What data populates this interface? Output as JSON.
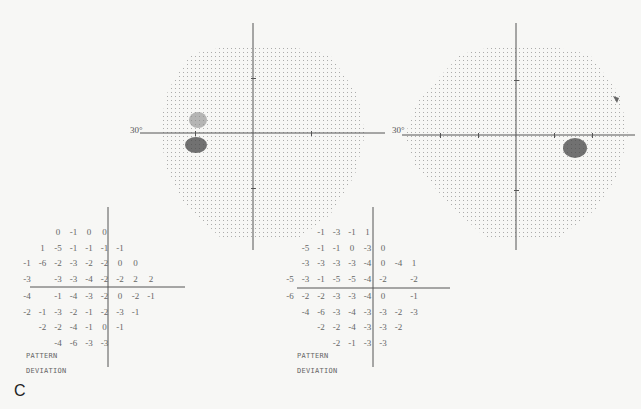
{
  "figure": {
    "panel_letter": "C",
    "left_field": {
      "eccentricity_label": "30°",
      "pattern_label": "PATTERN",
      "deviation_label": "DEVIATION",
      "rows": [
        [
          "",
          "",
          "0",
          "-1",
          "0",
          "0",
          "",
          "",
          ""
        ],
        [
          "",
          "1",
          "-5",
          "-1",
          "-1",
          "-1",
          "-1",
          "",
          ""
        ],
        [
          "-1",
          "-6",
          "-2",
          "-3",
          "-2",
          "-2",
          "0",
          "0",
          ""
        ],
        [
          "-3",
          "",
          "-3",
          "-3",
          "-4",
          "-2",
          "-2",
          "2",
          "2"
        ],
        [
          "-4",
          "",
          "-1",
          "-4",
          "-3",
          "-2",
          "0",
          "-2",
          "-1"
        ],
        [
          "-2",
          "-1",
          "-3",
          "-2",
          "-1",
          "-2",
          "-3",
          "-1",
          ""
        ],
        [
          "",
          "-2",
          "-2",
          "-4",
          "-1",
          "0",
          "-1",
          "",
          ""
        ],
        [
          "",
          "",
          "-4",
          "-6",
          "-3",
          "-3",
          "",
          "",
          ""
        ]
      ]
    },
    "right_field": {
      "eccentricity_label": "30°",
      "pattern_label": "PATTERN",
      "deviation_label": "DEVIATION",
      "rows": [
        [
          "",
          "",
          "-1",
          "-3",
          "-1",
          "1",
          "",
          "",
          ""
        ],
        [
          "",
          "-5",
          "-1",
          "-1",
          "0",
          "-3",
          "0",
          "",
          ""
        ],
        [
          "",
          "-3",
          "-3",
          "-3",
          "-3",
          "-4",
          "0",
          "-4",
          "1"
        ],
        [
          "-5",
          "-3",
          "-1",
          "-5",
          "-5",
          "-4",
          "-2",
          "",
          "-2"
        ],
        [
          "-6",
          "-2",
          "-2",
          "-3",
          "-3",
          "-4",
          "0",
          "",
          "-1"
        ],
        [
          "",
          "-4",
          "-6",
          "-3",
          "-4",
          "-3",
          "-3",
          "-2",
          "-3"
        ],
        [
          "",
          "",
          "-2",
          "-2",
          "-4",
          "-3",
          "-3",
          "-2",
          ""
        ],
        [
          "",
          "",
          "",
          "-2",
          "-1",
          "-3",
          "-3",
          "",
          ""
        ]
      ]
    }
  }
}
